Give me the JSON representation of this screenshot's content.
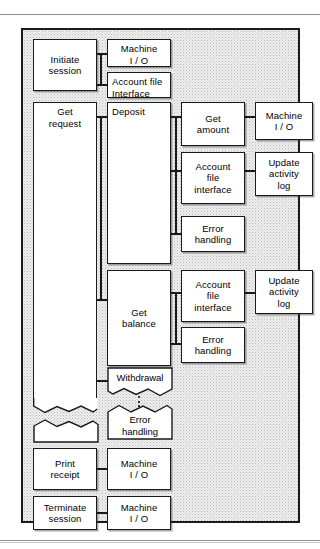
{
  "figure": {
    "type": "structure-chart",
    "title": "",
    "background_color": "#eeeeee",
    "frame_color": "#1a1a1a",
    "box_fill": "#ffffff"
  },
  "modules": {
    "initiate_session": "Initiate\nsession",
    "machine_io_1": "Machine\nI / O",
    "account_file_interface_1": "Account file\nInterface",
    "get_request": "Get\nrequest",
    "deposit": "Deposit",
    "get_amount": "Get\namount",
    "machine_io_2": "Machine\nI / O",
    "account_file_interface_2": "Account\nfile\ninterface",
    "update_activity_log_1": "Update\nactivity\nlog",
    "error_handling_1": "Error\nhandling",
    "get_balance": "Get\nbalance",
    "account_file_interface_3": "Account\nfile\ninterface",
    "update_activity_log_2": "Update\nactivity\nlog",
    "error_handling_2": "Error\nhandling",
    "withdrawal": "Withdrawal",
    "error_handling_3": "Error\nhandling",
    "print_receipt": "Print\nreceipt",
    "machine_io_3": "Machine\nI / O",
    "terminate_session": "Terminate\nsession",
    "machine_io_4": "Machine\nI / O"
  }
}
